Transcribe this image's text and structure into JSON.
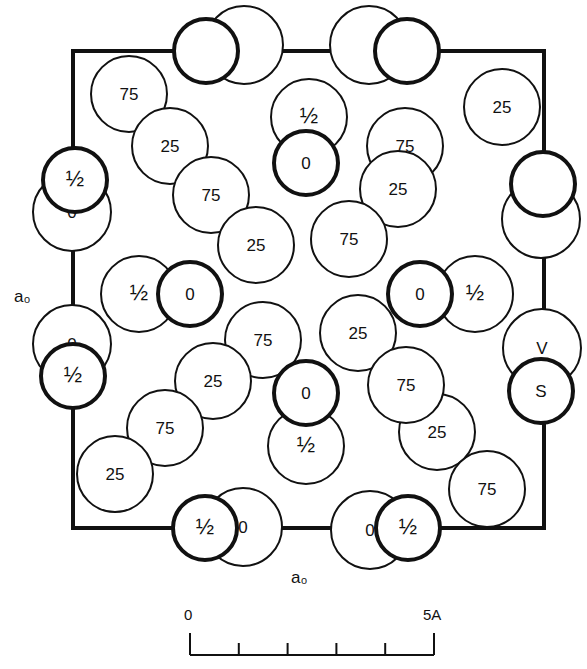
{
  "figure": {
    "axis_labels": {
      "left": "a₀",
      "bottom": "a₀"
    },
    "frame": {
      "left": 73,
      "top": 51,
      "right": 544,
      "bottom": 528
    },
    "atoms": [
      {
        "x": 244,
        "y": 45,
        "r": 39,
        "bold": false,
        "label": ""
      },
      {
        "x": 206,
        "y": 51,
        "r": 32,
        "bold": true,
        "label": ""
      },
      {
        "x": 369,
        "y": 45,
        "r": 39,
        "bold": false,
        "label": ""
      },
      {
        "x": 407,
        "y": 51,
        "r": 32,
        "bold": true,
        "label": ""
      },
      {
        "x": 72,
        "y": 212,
        "r": 39,
        "bold": false,
        "label": "0"
      },
      {
        "x": 75,
        "y": 180,
        "r": 32,
        "bold": true,
        "label": "½"
      },
      {
        "x": 72,
        "y": 344,
        "r": 39,
        "bold": false,
        "label": "0"
      },
      {
        "x": 73,
        "y": 376,
        "r": 32,
        "bold": true,
        "label": "½"
      },
      {
        "x": 541,
        "y": 219,
        "r": 39,
        "bold": false,
        "label": ""
      },
      {
        "x": 543,
        "y": 184,
        "r": 32,
        "bold": true,
        "label": ""
      },
      {
        "x": 542,
        "y": 348,
        "r": 39,
        "bold": false,
        "label": "V"
      },
      {
        "x": 541,
        "y": 391,
        "r": 32,
        "bold": true,
        "label": "S"
      },
      {
        "x": 243,
        "y": 527,
        "r": 39,
        "bold": false,
        "label": "0"
      },
      {
        "x": 205,
        "y": 528,
        "r": 32,
        "bold": true,
        "label": "½"
      },
      {
        "x": 370,
        "y": 530,
        "r": 39,
        "bold": false,
        "label": "0"
      },
      {
        "x": 408,
        "y": 528,
        "r": 32,
        "bold": true,
        "label": "½"
      },
      {
        "x": 129,
        "y": 94,
        "r": 38,
        "bold": false,
        "label": "75"
      },
      {
        "x": 170,
        "y": 146,
        "r": 38,
        "bold": false,
        "label": "25"
      },
      {
        "x": 211,
        "y": 195,
        "r": 38,
        "bold": false,
        "label": "75"
      },
      {
        "x": 256,
        "y": 245,
        "r": 38,
        "bold": false,
        "label": "25"
      },
      {
        "x": 306,
        "y": 163,
        "r": 32,
        "bold": true,
        "label": "0"
      },
      {
        "x": 309,
        "y": 117,
        "r": 38,
        "bold": false,
        "label": "½"
      },
      {
        "x": 502,
        "y": 107,
        "r": 38,
        "bold": false,
        "label": "25"
      },
      {
        "x": 405,
        "y": 146,
        "r": 38,
        "bold": false,
        "label": "75"
      },
      {
        "x": 398,
        "y": 189,
        "r": 38,
        "bold": false,
        "label": "25"
      },
      {
        "x": 349,
        "y": 239,
        "r": 38,
        "bold": false,
        "label": "75"
      },
      {
        "x": 190,
        "y": 294,
        "r": 32,
        "bold": true,
        "label": "0"
      },
      {
        "x": 139,
        "y": 294,
        "r": 38,
        "bold": false,
        "label": "½"
      },
      {
        "x": 420,
        "y": 294,
        "r": 32,
        "bold": true,
        "label": "0"
      },
      {
        "x": 475,
        "y": 294,
        "r": 38,
        "bold": false,
        "label": "½"
      },
      {
        "x": 263,
        "y": 340,
        "r": 38,
        "bold": false,
        "label": "75"
      },
      {
        "x": 213,
        "y": 381,
        "r": 38,
        "bold": false,
        "label": "25"
      },
      {
        "x": 165,
        "y": 428,
        "r": 38,
        "bold": false,
        "label": "75"
      },
      {
        "x": 115,
        "y": 474,
        "r": 38,
        "bold": false,
        "label": "25"
      },
      {
        "x": 358,
        "y": 333,
        "r": 38,
        "bold": false,
        "label": "25"
      },
      {
        "x": 437,
        "y": 432,
        "r": 38,
        "bold": false,
        "label": "25"
      },
      {
        "x": 406,
        "y": 385,
        "r": 38,
        "bold": false,
        "label": "75"
      },
      {
        "x": 487,
        "y": 489,
        "r": 38,
        "bold": false,
        "label": "75"
      },
      {
        "x": 306,
        "y": 393,
        "r": 32,
        "bold": true,
        "label": "0"
      },
      {
        "x": 306,
        "y": 446,
        "r": 38,
        "bold": false,
        "label": "½"
      }
    ],
    "scale_bar": {
      "start_label": "0",
      "end_label": "5A",
      "x0": 190,
      "x1": 434,
      "y": 655,
      "tick_count": 5
    }
  }
}
